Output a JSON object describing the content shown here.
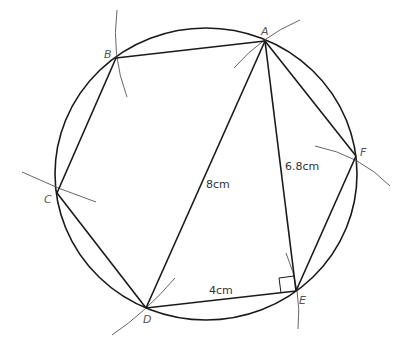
{
  "diagram": {
    "points": {
      "A": {
        "label": "A",
        "x": 265,
        "y": 41
      },
      "B": {
        "label": "B",
        "x": 116,
        "y": 58
      },
      "C": {
        "label": "C",
        "x": 57,
        "y": 193
      },
      "D": {
        "label": "D",
        "x": 146,
        "y": 308
      },
      "E": {
        "label": "E",
        "x": 296,
        "y": 291
      },
      "F": {
        "label": "F",
        "x": 356,
        "y": 156
      }
    },
    "measurements": {
      "AD": "8cm",
      "AE": "6.8cm",
      "DE": "4cm"
    },
    "right_angle_at": "E"
  }
}
